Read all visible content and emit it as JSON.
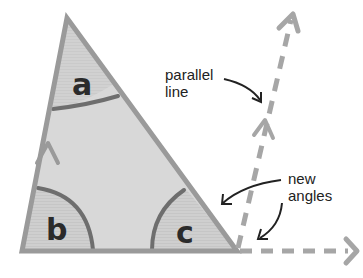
{
  "diagram": {
    "colors": {
      "background": "#ffffff",
      "triangle_fill": "#d6d6d6",
      "triangle_stroke": "#9a9a9a",
      "angle_fill": "#c8c8c8",
      "arc_stroke": "#6e6e6e",
      "dashed_line": "#a6a6a6",
      "text": "#222222",
      "pointer_arrow": "#222222"
    },
    "triangle": {
      "vertices": {
        "top": [
          67,
          18
        ],
        "bottom_left": [
          22,
          251
        ],
        "bottom_right": [
          237,
          251
        ]
      }
    },
    "angles": [
      {
        "id": "a",
        "label": "a",
        "vertex": "top"
      },
      {
        "id": "b",
        "label": "b",
        "vertex": "bottom_left"
      },
      {
        "id": "c",
        "label": "c",
        "vertex": "bottom_right"
      }
    ],
    "annotations": [
      {
        "id": "parallel-line",
        "lines": [
          "parallel",
          "line"
        ]
      },
      {
        "id": "new-angles",
        "lines": [
          "new",
          "angles"
        ]
      }
    ]
  }
}
